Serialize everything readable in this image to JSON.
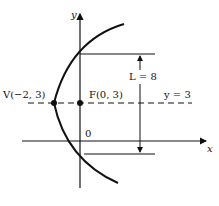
{
  "diagram": {
    "type": "parabola",
    "axes": {
      "x_label": "x",
      "y_label": "y",
      "origin_label": "0"
    },
    "vertex": {
      "label": "V(−2, 3)",
      "x": -2,
      "y": 3
    },
    "focus": {
      "label": "F(0, 3)",
      "x": 0,
      "y": 3
    },
    "axis_of_symmetry": {
      "label": "y = 3"
    },
    "latus_rectum": {
      "label": "L = 8",
      "length": 8
    },
    "colors": {
      "stroke": "#111111",
      "background": "#ffffff"
    }
  }
}
